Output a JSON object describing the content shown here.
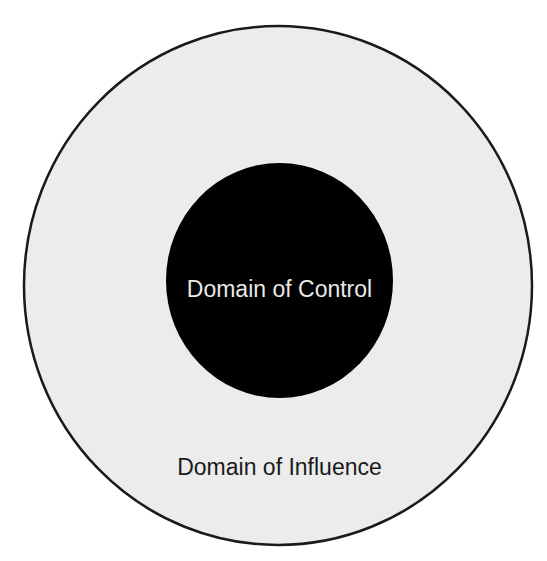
{
  "diagram": {
    "type": "concentric-circles",
    "outer": {
      "label": "Domain of Influence",
      "fill": "#ececec",
      "stroke": "#1a1a1a",
      "label_color": "#1a1a1a"
    },
    "inner": {
      "label": "Domain of Control",
      "fill": "#000000",
      "label_color": "#e8e8e8"
    },
    "background": "#ffffff"
  }
}
